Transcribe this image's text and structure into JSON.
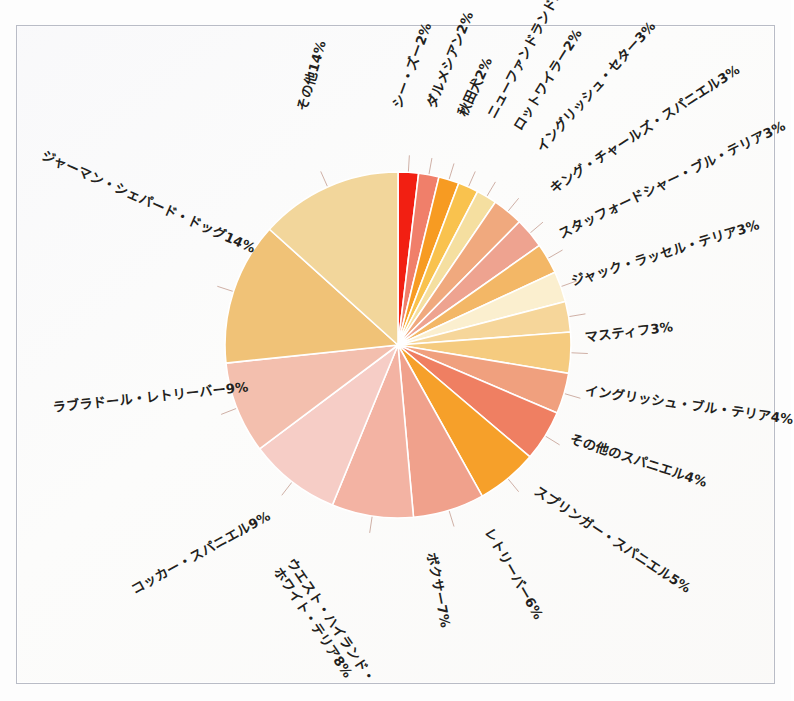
{
  "figure": {
    "kind": "pie-chart-figure",
    "background_color": "#fcfcfb",
    "frame_color": "#b9bcc6"
  },
  "chart_data": {
    "type": "pie",
    "title": "",
    "xlabel": "",
    "ylabel": "",
    "legend_position": "none",
    "grid": false,
    "label_format": "{name}{value}%",
    "start_angle_deg": 0,
    "direction": "clockwise",
    "categories": [
      "シー・ズー",
      "ダルメシアン",
      "秋田犬",
      "ニューファンドランド",
      "ロットワイラー",
      "イングリッシュ・セター",
      "キング・チャールズ・スパニエル",
      "スタッフォードシャー・ブル・テリア",
      "ジャック・ラッセル・テリア",
      "マスティフ",
      "イングリッシュ・ブル・テリア",
      "その他のスパニエル",
      "スプリンガー・スパニエル",
      "レトリーバー",
      "ボクサー",
      "ウエスト・ハイランド・ホワイト・テリア",
      "コッカー・スパニエル",
      "ラブラドール・レトリーバー",
      "ジャーマン・シェパード・ドッグ",
      "その他"
    ],
    "values": [
      2,
      2,
      2,
      2,
      2,
      3,
      3,
      3,
      3,
      3,
      4,
      4,
      5,
      6,
      7,
      8,
      9,
      9,
      14,
      14
    ],
    "units": "%",
    "colors": [
      "#f21f12",
      "#f07f6a",
      "#f79b22",
      "#f9c24e",
      "#f5dfa0",
      "#f0a97e",
      "#eea390",
      "#f3b766",
      "#fbefcf",
      "#f6d69a",
      "#f5cb7f",
      "#f0a07e",
      "#ef7f62",
      "#f6a02a",
      "#f0a18c",
      "#f3b3a3",
      "#f6cdc6",
      "#f3bfae",
      "#f0c277",
      "#f2d69b"
    ],
    "slice_labels": [
      {
        "name": "シー・ズー",
        "value": 2,
        "text": "シー・ズー2%"
      },
      {
        "name": "ダルメシアン",
        "value": 2,
        "text": "ダルメシアン2%"
      },
      {
        "name": "秋田犬",
        "value": 2,
        "text": "秋田犬2%"
      },
      {
        "name": "ニューファンドランド",
        "value": 2,
        "text": "ニューファンドランド2%"
      },
      {
        "name": "ロットワイラー",
        "value": 2,
        "text": "ロットワイラー2%"
      },
      {
        "name": "イングリッシュ・セター",
        "value": 3,
        "text": "イングリッシュ・セター3%"
      },
      {
        "name": "キング・チャールズ・スパニエル",
        "value": 3,
        "text": "キング・チャールズ・スパニエル3%"
      },
      {
        "name": "スタッフォードシャー・ブル・テリア",
        "value": 3,
        "text": "スタッフォードシャー・ブル・テリア3%"
      },
      {
        "name": "ジャック・ラッセル・テリア",
        "value": 3,
        "text": "ジャック・ラッセル・テリア3%"
      },
      {
        "name": "マスティフ",
        "value": 3,
        "text": "マスティフ3%"
      },
      {
        "name": "イングリッシュ・ブル・テリア",
        "value": 4,
        "text": "イングリッシュ・ブル・テリア4%"
      },
      {
        "name": "その他のスパニエル",
        "value": 4,
        "text": "その他のスパニエル4%"
      },
      {
        "name": "スプリンガー・スパニエル",
        "value": 5,
        "text": "スプリンガー・スパニエル5%"
      },
      {
        "name": "レトリーバー",
        "value": 6,
        "text": "レトリーバー6%"
      },
      {
        "name": "ボクサー",
        "value": 7,
        "text": "ボクサー7%"
      },
      {
        "name": "ウエスト・ハイランド・ホワイト・テリア",
        "value": 8,
        "text": "ウエスト・ハイランド・ホワイト・テリア8%"
      },
      {
        "name": "コッカー・スパニエル",
        "value": 9,
        "text": "コッカー・スパニエル9%"
      },
      {
        "name": "ラブラドール・レトリーバー",
        "value": 9,
        "text": "ラブラドール・レトリーバー9%"
      },
      {
        "name": "ジャーマン・シェパード・ドッグ",
        "value": 14,
        "text": "ジャーマン・シェパード・ドッグ14%"
      },
      {
        "name": "その他",
        "value": 14,
        "text": "その他14%"
      }
    ]
  },
  "labels": [
    {
      "id": "shih-tzu",
      "line1": "シー・ズー2%",
      "line2": "",
      "x": 398,
      "y": 100,
      "rot": -70
    },
    {
      "id": "dalmatian",
      "line1": "ダルメシアン2%",
      "line2": "",
      "x": 432,
      "y": 100,
      "rot": -68
    },
    {
      "id": "akita",
      "line1": "秋田犬2%",
      "line2": "",
      "x": 463,
      "y": 108,
      "rot": -65
    },
    {
      "id": "newfoundland",
      "line1": "ニューファンドランド2%",
      "line2": "",
      "x": 492,
      "y": 110,
      "rot": -62
    },
    {
      "id": "rottweiler",
      "line1": "ロットワイラー2%",
      "line2": "",
      "x": 518,
      "y": 122,
      "rot": -58
    },
    {
      "id": "english-setter",
      "line1": "イングリッシュ・セター3%",
      "line2": "",
      "x": 540,
      "y": 143,
      "rot": -48
    },
    {
      "id": "king-charles",
      "line1": "キング・チャールズ・スパニエル3%",
      "line2": "",
      "x": 552,
      "y": 183,
      "rot": -33
    },
    {
      "id": "staffordshire",
      "line1": "スタッフォードシャー・ブル・テリア3%",
      "line2": "",
      "x": 560,
      "y": 228,
      "rot": -26
    },
    {
      "id": "jack-russell",
      "line1": "ジャック・ラッセル・テリア3%",
      "line2": "",
      "x": 572,
      "y": 275,
      "rot": -17
    },
    {
      "id": "mastiff",
      "line1": "マスティフ3%",
      "line2": "",
      "x": 585,
      "y": 331,
      "rot": -7
    },
    {
      "id": "english-bull",
      "line1": "イングリッシュ・ブル・テリア4%",
      "line2": "",
      "x": 585,
      "y": 384,
      "rot": 8
    },
    {
      "id": "other-spaniel",
      "line1": "その他のスパニエル4%",
      "line2": "",
      "x": 570,
      "y": 432,
      "rot": 18
    },
    {
      "id": "springer",
      "line1": "スプリンガー・スパニエル5%",
      "line2": "",
      "x": 535,
      "y": 483,
      "rot": 33
    },
    {
      "id": "retriever",
      "line1": "レトリーバー6%",
      "line2": "",
      "x": 487,
      "y": 522,
      "rot": 60
    },
    {
      "id": "boxer",
      "line1": "ボクサー7%",
      "line2": "",
      "x": 430,
      "y": 545,
      "rot": 79
    },
    {
      "id": "westie",
      "line1": "ウエスト・ハイランド・",
      "line2": "ホワイト・テリア8%",
      "x": 282,
      "y": 549,
      "rot": 56
    },
    {
      "id": "cocker",
      "line1": "コッカー・スパニエル9%",
      "line2": "",
      "x": 133,
      "y": 584,
      "rot": -29
    },
    {
      "id": "labrador",
      "line1": "ラブラドール・レトリーバー9%",
      "line2": "",
      "x": 53,
      "y": 401,
      "rot": -6
    },
    {
      "id": "german-shepherd",
      "line1": "ジャーマン・シェパード・ドッグ14%",
      "line2": "",
      "x": 42,
      "y": 148,
      "rot": 24
    },
    {
      "id": "others",
      "line1": "その他14%",
      "line2": "",
      "x": 303,
      "y": 103,
      "rot": -74
    }
  ],
  "geometry": {
    "center_x": 398,
    "center_y": 345,
    "radius": 173
  }
}
